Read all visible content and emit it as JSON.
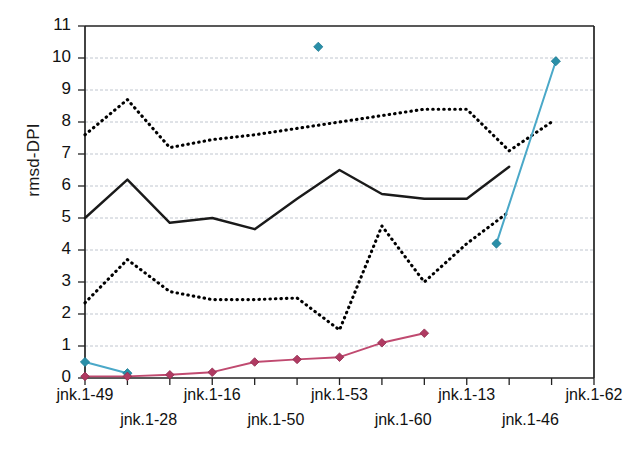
{
  "chart_data": {
    "type": "line",
    "title": "",
    "xlabel": "",
    "ylabel": "rmsd-DPI",
    "ylim": [
      0,
      11
    ],
    "ytick_labels": [
      "0",
      "1",
      "2",
      "3",
      "4",
      "5",
      "6",
      "7",
      "8",
      "9",
      "10",
      "11"
    ],
    "grid": true,
    "legend_position": "none",
    "categories": [
      "jnk.1-49",
      "jnk.1-28",
      "jnk.1-16",
      "jnk.1-50",
      "jnk.1-53",
      "jnk.1-60",
      "jnk.1-13",
      "jnk.1-46",
      "jnk.1-62"
    ],
    "x_labels_row1": [
      "jnk.1-49",
      "jnk.1-16",
      "jnk.1-53",
      "jnk.1-13",
      "jnk.1-62"
    ],
    "x_labels_row2": [
      "jnk.1-28",
      "jnk.1-50",
      "jnk.1-60",
      "jnk.1-46"
    ],
    "n_ticks": 13,
    "series": [
      {
        "name": "upper-dotted",
        "style": "dotted",
        "color": "#000000",
        "x": [
          0,
          1,
          2,
          3,
          4,
          5,
          6,
          7,
          8,
          9,
          10,
          11,
          12
        ],
        "values": [
          7.6,
          8.7,
          7.2,
          7.45,
          7.6,
          7.8,
          8.0,
          8.2,
          8.4,
          8.4,
          7.1,
          8.0,
          null
        ]
      },
      {
        "name": "solid-black-mean",
        "style": "solid",
        "color": "#1a1a1a",
        "x": [
          0,
          1,
          2,
          3,
          4,
          5,
          6,
          7,
          8,
          9,
          10,
          11,
          12
        ],
        "values": [
          5.0,
          6.2,
          4.85,
          5.0,
          4.65,
          5.6,
          6.5,
          5.75,
          5.6,
          5.6,
          6.6,
          null,
          null
        ]
      },
      {
        "name": "lower-dotted",
        "style": "dotted",
        "color": "#000000",
        "x": [
          0,
          1,
          2,
          3,
          4,
          5,
          6,
          7,
          8,
          9,
          10,
          11,
          12
        ],
        "values": [
          2.35,
          3.7,
          2.7,
          2.45,
          2.45,
          2.5,
          1.5,
          4.75,
          3.0,
          4.2,
          5.2,
          null,
          null
        ]
      },
      {
        "name": "teal-markers",
        "style": "solid-with-diamond-markers",
        "color": "#4aa8c8",
        "marker_color": "#2a8fa8",
        "points": [
          {
            "x": 0,
            "y": 0.5
          },
          {
            "x": 1,
            "y": 0.15
          },
          {
            "x": 5.5,
            "y": 10.35
          },
          {
            "x": 9.7,
            "y": 4.2
          },
          {
            "x": 11.1,
            "y": 9.9
          }
        ]
      },
      {
        "name": "magenta-markers",
        "style": "solid-with-diamond-markers",
        "color": "#c04a70",
        "marker_color": "#b03a62",
        "points": [
          {
            "x": 0,
            "y": 0.05
          },
          {
            "x": 1,
            "y": 0.05
          },
          {
            "x": 2,
            "y": 0.1
          },
          {
            "x": 3,
            "y": 0.18
          },
          {
            "x": 4,
            "y": 0.5
          },
          {
            "x": 5,
            "y": 0.58
          },
          {
            "x": 6,
            "y": 0.65
          },
          {
            "x": 7,
            "y": 1.1
          },
          {
            "x": 8,
            "y": 1.4
          }
        ]
      }
    ]
  },
  "axes": {
    "y_title": "rmsd-DPI"
  }
}
